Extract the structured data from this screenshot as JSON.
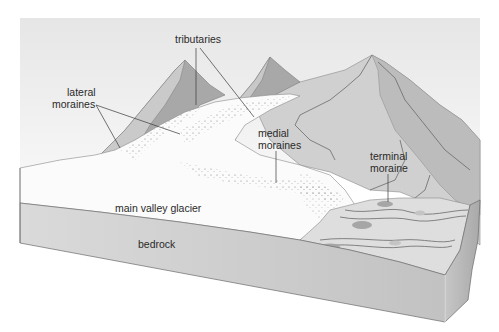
{
  "figure": {
    "colors": {
      "background": "#ffffff",
      "sky": "#ececec",
      "glacier_ice": "#fbfbfb",
      "mountain_light": "#d4d4d4",
      "mountain_mid": "#bdbdbd",
      "mountain_dark": "#a3a3a3",
      "bedrock_front": "#cfcfcf",
      "bedrock_side": "#b9b9b9",
      "outwash_plain": "#dedede",
      "label_text": "#2a2a2a"
    },
    "labels": {
      "tributaries": "tributaries",
      "lateral_moraines_line1": "lateral",
      "lateral_moraines_line2": "moraines",
      "medial_moraines_line1": "medial",
      "medial_moraines_line2": "moraines",
      "terminal_moraine_line1": "terminal",
      "terminal_moraine_line2": "moraine",
      "main_valley_glacier": "main valley glacier",
      "bedrock": "bedrock"
    }
  }
}
